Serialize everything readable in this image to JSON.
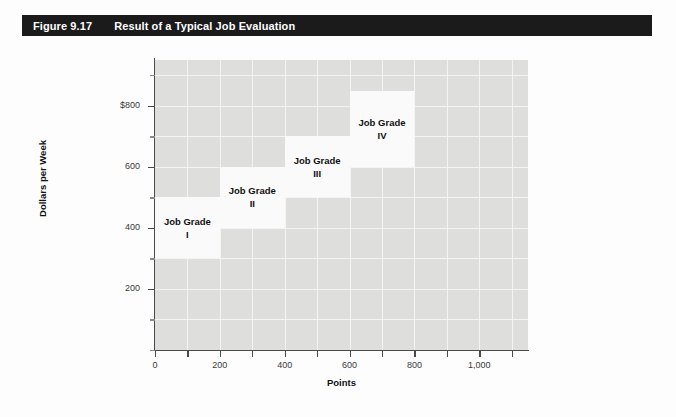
{
  "figure": {
    "number": "Figure 9.17",
    "title": "Result of a Typical Job Evaluation"
  },
  "chart_data": {
    "type": "bar",
    "title": "Result of a Typical Job Evaluation",
    "xlabel": "Points",
    "ylabel": "Dollars per Week",
    "xlim": [
      0,
      1150
    ],
    "ylim": [
      0,
      950
    ],
    "grid": true,
    "legend": false,
    "x_ticks": [
      0,
      100,
      200,
      300,
      400,
      500,
      600,
      700,
      800,
      900,
      1000,
      1100
    ],
    "x_tick_labels": [
      "0",
      "",
      "200",
      "",
      "400",
      "",
      "600",
      "",
      "800",
      "",
      "1,000",
      ""
    ],
    "y_ticks": [
      0,
      100,
      200,
      300,
      400,
      500,
      600,
      700,
      800,
      900
    ],
    "y_tick_labels": [
      "",
      "",
      "200",
      "",
      "400",
      "",
      "600",
      "",
      "$800",
      ""
    ],
    "boxes": [
      {
        "label": "Job Grade",
        "roman": "I",
        "x_start": 0,
        "x_end": 200,
        "y_start": 300,
        "y_end": 500
      },
      {
        "label": "Job Grade",
        "roman": "II",
        "x_start": 200,
        "x_end": 400,
        "y_start": 400,
        "y_end": 600
      },
      {
        "label": "Job Grade",
        "roman": "III",
        "x_start": 400,
        "x_end": 600,
        "y_start": 500,
        "y_end": 700
      },
      {
        "label": "Job Grade",
        "roman": "IV",
        "x_start": 600,
        "x_end": 800,
        "y_start": 600,
        "y_end": 850
      }
    ],
    "colors": {
      "plot_background": "#dededc",
      "box_fill": "#fafafa",
      "gridline": "#f4f4f2",
      "axis": "#4a4a4a",
      "title_bar": "#1b1b1b",
      "title_text": "#ffffff"
    }
  }
}
